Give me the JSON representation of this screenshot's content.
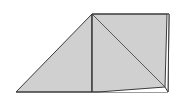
{
  "diagram": {
    "width": 182,
    "height": 98,
    "fill_color": "#d0d0d0",
    "stroke_color": "#3a3a3a",
    "background": "#ffffff",
    "points": {
      "A": [
        16,
        92
      ],
      "B": [
        92,
        14
      ],
      "C": [
        169,
        14
      ],
      "D": [
        168,
        92
      ],
      "E": [
        92,
        92
      ],
      "F": [
        165,
        87
      ]
    },
    "shapes": [
      {
        "name": "left-triangle",
        "points": "16,92 92,14 92,92"
      },
      {
        "name": "right-quad",
        "points": "92,14 169,14 168,92 92,92"
      }
    ],
    "lines": [
      {
        "name": "vertical-divider",
        "from": [
          92,
          14
        ],
        "to": [
          92,
          92
        ]
      },
      {
        "name": "diagonal",
        "from": [
          92,
          14
        ],
        "to": [
          165,
          87
        ]
      },
      {
        "name": "inner-bottom",
        "from": [
          98,
          92
        ],
        "to": [
          165,
          87
        ]
      },
      {
        "name": "inner-right",
        "from": [
          165,
          87
        ],
        "to": [
          167,
          14
        ]
      }
    ]
  }
}
